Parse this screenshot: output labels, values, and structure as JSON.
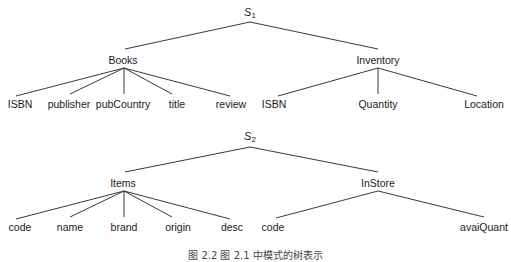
{
  "trees": [
    {
      "root": {
        "label": "S",
        "subscript": "1"
      },
      "children": [
        {
          "label": "Books",
          "children": [
            "ISBN",
            "publisher",
            "pubCountry",
            "title",
            "review"
          ]
        },
        {
          "label": "Inventory",
          "children": [
            "ISBN",
            "Quantity",
            "Location"
          ]
        }
      ]
    },
    {
      "root": {
        "label": "S",
        "subscript": "2"
      },
      "children": [
        {
          "label": "Items",
          "children": [
            "code",
            "name",
            "brand",
            "origin",
            "desc"
          ]
        },
        {
          "label": "InStore",
          "children": [
            "code",
            "avaiQuant"
          ]
        }
      ]
    }
  ],
  "caption": "图 2.2 图 2.1 中模式的树表示",
  "colors": {
    "line": "#3a3a3a",
    "text": "#1a1a1a",
    "background": "#ffffff"
  }
}
